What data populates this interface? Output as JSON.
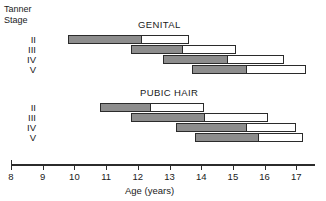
{
  "chart_data": {
    "type": "bar",
    "title": "",
    "xlabel": "Age (years)",
    "ylabel": "Tanner Stage",
    "xlim": [
      8,
      17.6
    ],
    "xticks": [
      8,
      9,
      10,
      11,
      12,
      13,
      14,
      15,
      16,
      17
    ],
    "grid": false,
    "legend_position": "none",
    "bar_style": "range bar with shaded first portion and open second portion",
    "colors": {
      "shaded": "#8d8d8d",
      "open": "#ffffff",
      "outline": "#2b2b2b"
    },
    "panels": [
      {
        "label": "GENITAL",
        "categories": [
          "II",
          "III",
          "IV",
          "V"
        ],
        "bars": [
          {
            "stage": "II",
            "start": 9.8,
            "mid": 12.1,
            "end": 13.6
          },
          {
            "stage": "III",
            "start": 11.8,
            "mid": 13.4,
            "end": 15.1
          },
          {
            "stage": "IV",
            "start": 12.8,
            "mid": 14.8,
            "end": 16.6
          },
          {
            "stage": "V",
            "start": 13.7,
            "mid": 15.4,
            "end": 17.3
          }
        ]
      },
      {
        "label": "PUBIC HAIR",
        "categories": [
          "II",
          "III",
          "IV",
          "V"
        ],
        "bars": [
          {
            "stage": "II",
            "start": 10.8,
            "mid": 12.4,
            "end": 14.1
          },
          {
            "stage": "III",
            "start": 11.8,
            "mid": 14.1,
            "end": 16.1
          },
          {
            "stage": "IV",
            "start": 13.2,
            "mid": 15.4,
            "end": 17.0
          },
          {
            "stage": "V",
            "start": 13.8,
            "mid": 15.8,
            "end": 17.2
          }
        ]
      }
    ]
  },
  "axis": {
    "title": "Age (years)",
    "ticks": [
      "8",
      "9",
      "10",
      "11",
      "12",
      "13",
      "14",
      "15",
      "16",
      "17"
    ]
  },
  "stage_header": {
    "line1": "Tanner",
    "line2": "Stage"
  },
  "panel_titles": {
    "genital": "GENITAL",
    "pubic": "PUBIC HAIR"
  },
  "stage_labels": [
    "II",
    "III",
    "IV",
    "V"
  ]
}
